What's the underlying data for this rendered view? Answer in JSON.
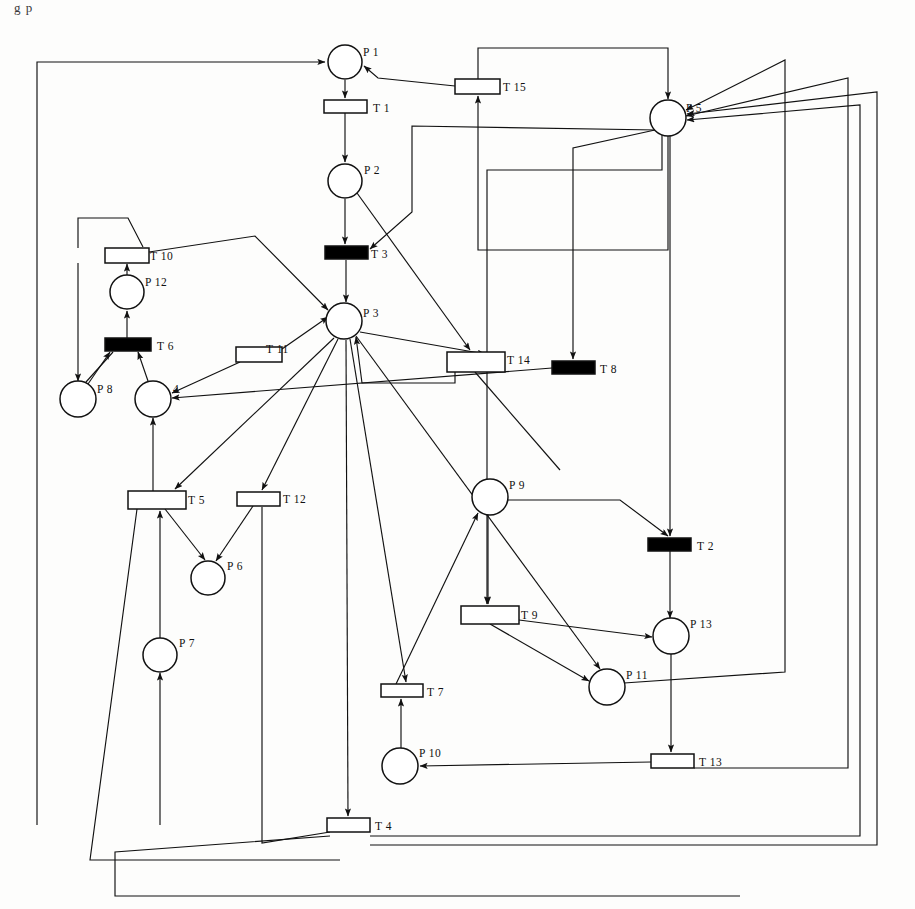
{
  "figure": {
    "title_fragment": "g   p",
    "type": "petri-net",
    "background": "#fdfdfc",
    "stroke": "#111111",
    "fill_place": "#ffffff",
    "fill_transition_immediate": "#ffffff",
    "fill_transition_timed": "#000000"
  },
  "places": [
    {
      "id": "P1",
      "label": "P 1",
      "cx": 345,
      "cy": 62,
      "r": 17,
      "label_dx": 18,
      "label_dy": -6
    },
    {
      "id": "P2",
      "label": "P 2",
      "cx": 345,
      "cy": 181,
      "r": 17,
      "label_dx": 19,
      "label_dy": -7
    },
    {
      "id": "P3",
      "label": "P 3",
      "cx": 344,
      "cy": 321,
      "r": 18,
      "label_dx": 19,
      "label_dy": -4
    },
    {
      "id": "P4",
      "label": "4",
      "cx": 153,
      "cy": 399,
      "r": 18,
      "label_dx": 20,
      "label_dy": -6
    },
    {
      "id": "P5",
      "label": "P 5",
      "cx": 668,
      "cy": 118,
      "r": 18,
      "label_dx": 18,
      "label_dy": -6
    },
    {
      "id": "P6",
      "label": "P 6",
      "cx": 208,
      "cy": 578,
      "r": 17,
      "label_dx": 19,
      "label_dy": -8
    },
    {
      "id": "P7",
      "label": "P 7",
      "cx": 160,
      "cy": 655,
      "r": 17,
      "label_dx": 19,
      "label_dy": -8
    },
    {
      "id": "P8",
      "label": "P 8",
      "cx": 78,
      "cy": 399,
      "r": 18,
      "label_dx": 19,
      "label_dy": -6
    },
    {
      "id": "P9",
      "label": "P 9",
      "cx": 490,
      "cy": 497,
      "r": 18,
      "label_dx": 19,
      "label_dy": -8
    },
    {
      "id": "P10",
      "label": "P 10",
      "cx": 400,
      "cy": 766,
      "r": 18,
      "label_dx": 19,
      "label_dy": -9
    },
    {
      "id": "P11",
      "label": "P 11",
      "cx": 607,
      "cy": 687,
      "r": 18,
      "label_dx": 19,
      "label_dy": -8
    },
    {
      "id": "P12",
      "label": "P 12",
      "cx": 127,
      "cy": 292,
      "r": 17,
      "label_dx": 18,
      "label_dy": -6
    },
    {
      "id": "P13",
      "label": "P 13",
      "cx": 671,
      "cy": 636,
      "r": 18,
      "label_dx": 19,
      "label_dy": -8
    }
  ],
  "transitions": [
    {
      "id": "T1",
      "label": "T 1",
      "x": 324,
      "y": 100,
      "w": 43,
      "h": 13,
      "timed": false,
      "label_dx": 49,
      "label_dy": 1
    },
    {
      "id": "T2",
      "label": "T 2",
      "x": 648,
      "y": 538,
      "w": 43,
      "h": 13,
      "timed": true,
      "label_dx": 49,
      "label_dy": 1
    },
    {
      "id": "T3",
      "label": "T 3",
      "x": 325,
      "y": 246,
      "w": 43,
      "h": 13,
      "timed": true,
      "label_dx": 46,
      "label_dy": 1
    },
    {
      "id": "T4",
      "label": "T 4",
      "x": 327,
      "y": 818,
      "w": 43,
      "h": 14,
      "timed": false,
      "label_dx": 48,
      "label_dy": 1
    },
    {
      "id": "T5",
      "label": "T 5",
      "x": 128,
      "y": 491,
      "w": 58,
      "h": 18,
      "timed": false,
      "label_dx": 60,
      "label_dy": 0
    },
    {
      "id": "T6",
      "label": "T 6",
      "x": 105,
      "y": 338,
      "w": 46,
      "h": 13,
      "timed": true,
      "label_dx": 52,
      "label_dy": 1
    },
    {
      "id": "T7",
      "label": "T 7",
      "x": 381,
      "y": 684,
      "w": 42,
      "h": 13,
      "timed": false,
      "label_dx": 46,
      "label_dy": 1
    },
    {
      "id": "T8",
      "label": "T 8",
      "x": 552,
      "y": 361,
      "w": 43,
      "h": 13,
      "timed": true,
      "label_dx": 48,
      "label_dy": 1
    },
    {
      "id": "T9",
      "label": "T 9",
      "x": 461,
      "y": 606,
      "w": 58,
      "h": 18,
      "timed": false,
      "label_dx": 60,
      "label_dy": 0
    },
    {
      "id": "T10",
      "label": "T 10",
      "x": 105,
      "y": 248,
      "w": 44,
      "h": 15,
      "timed": false,
      "label_dx": 45,
      "label_dy": 0
    },
    {
      "id": "T11",
      "label": "T 11",
      "x": 236,
      "y": 347,
      "w": 46,
      "h": 15,
      "timed": false,
      "label_dx": 30,
      "label_dy": -6
    },
    {
      "id": "T12",
      "label": "T 12",
      "x": 237,
      "y": 492,
      "w": 43,
      "h": 14,
      "timed": false,
      "label_dx": 46,
      "label_dy": 0
    },
    {
      "id": "T13",
      "label": "T 13",
      "x": 651,
      "y": 754,
      "w": 43,
      "h": 14,
      "timed": false,
      "label_dx": 48,
      "label_dy": 1
    },
    {
      "id": "T14",
      "label": "T 14",
      "x": 447,
      "y": 352,
      "w": 58,
      "h": 20,
      "timed": false,
      "label_dx": 60,
      "label_dy": -2
    },
    {
      "id": "T15",
      "label": "T 15",
      "x": 455,
      "y": 79,
      "w": 45,
      "h": 15,
      "timed": false,
      "label_dx": 48,
      "label_dy": 0
    }
  ],
  "arcs": [
    {
      "from": "T15",
      "to": "P1",
      "path": "M455,86 L378,78 L364,66",
      "arrow": true
    },
    {
      "from": "T4",
      "to": "P1",
      "path": "M37,825 L37,62 L325,62",
      "arrow": true
    },
    {
      "from": "P1",
      "to": "T1",
      "path": "M345,80 L345,98",
      "arrow": true
    },
    {
      "from": "T1",
      "to": "P2",
      "path": "M345,113 L345,162",
      "arrow": true
    },
    {
      "from": "P2",
      "to": "T3",
      "path": "M345,199 L345,244",
      "arrow": true
    },
    {
      "from": "P2",
      "to": "T14",
      "path": "M357,193 L470,350",
      "arrow": true
    },
    {
      "from": "T3",
      "to": "P3",
      "path": "M346,260 L346,302",
      "arrow": true
    },
    {
      "from": "P5",
      "to": "T3",
      "path": "M657,130 L412,126 L412,212 L370,249",
      "arrow": true
    },
    {
      "from": "T15",
      "to": "P5",
      "path": "M478,79 L478,48 L668,48 L668,99",
      "arrow": true
    },
    {
      "from": "P5",
      "to": "T15",
      "path": "M668,136 L668,250 L478,250 L478,96",
      "arrow": true
    },
    {
      "from": "T10",
      "to": "P3",
      "path": "M149,252 L255,236 L328,310",
      "arrow": true
    },
    {
      "from": "T6",
      "to": "P12",
      "path": "M127,338 L127,311",
      "arrow": true
    },
    {
      "from": "P12",
      "to": "T10",
      "path": "M127,275 L127,264",
      "arrow": true
    },
    {
      "from": "T10b",
      "to": "P12",
      "path": "M78,248 L78,218 L128,218 L143,247",
      "arrow": false
    },
    {
      "from": "T6",
      "to": "P8",
      "path": "M113,352 L86,382",
      "arrow": false
    },
    {
      "from": "T10",
      "to": "P8",
      "path": "M78,263 L78,381",
      "arrow": true
    },
    {
      "from": "P4",
      "to": "T6",
      "path": "M148,381 L138,352",
      "arrow": true
    },
    {
      "from": "P8",
      "to": "T6",
      "path": "M88,384 L110,352",
      "arrow": true
    },
    {
      "from": "T11",
      "to": "P3",
      "path": "M282,349 L328,317",
      "arrow": true
    },
    {
      "from": "T11",
      "to": "P4",
      "path": "M240,362 L172,393",
      "arrow": true
    },
    {
      "from": "P3",
      "to": "T14",
      "path": "M360,332 L485,354",
      "arrow": true
    },
    {
      "from": "T14",
      "to": "P3",
      "path": "M455,372 L455,383 L362,383 L356,337",
      "arrow": true
    },
    {
      "from": "T8",
      "to": "P4",
      "path": "M552,368 L172,398",
      "arrow": true
    },
    {
      "from": "P5",
      "to": "T8",
      "path": "M655,130 L573,148 L573,359",
      "arrow": true
    },
    {
      "from": "T14",
      "to": "T8",
      "path": "M475,372 L560,470",
      "arrow": false
    },
    {
      "from": "P3",
      "to": "T5",
      "path": "M334,338 L175,489",
      "arrow": true
    },
    {
      "from": "P3",
      "to": "T12",
      "path": "M338,339 L262,490",
      "arrow": true
    },
    {
      "from": "T5",
      "to": "P4",
      "path": "M153,491 L153,418",
      "arrow": true
    },
    {
      "from": "T5",
      "to": "P6",
      "path": "M165,509 L205,560",
      "arrow": true
    },
    {
      "from": "T12",
      "to": "P6",
      "path": "M253,506 L216,561",
      "arrow": true
    },
    {
      "from": "P7",
      "to": "T5",
      "path": "M160,638 L160,511",
      "arrow": true
    },
    {
      "from": "T4",
      "to": "P7",
      "path": "M160,825 L160,673",
      "arrow": true
    },
    {
      "from": "T12",
      "to": "T4",
      "path": "M262,507 L262,843 L330,832",
      "arrow": false
    },
    {
      "from": "P3",
      "to": "T4",
      "path": "M346,340 L348,816",
      "arrow": true
    },
    {
      "from": "P9",
      "to": "T9",
      "path": "M488,515 L488,604",
      "arrow": true
    },
    {
      "from": "P3",
      "to": "T7",
      "path": "M350,339 L406,682",
      "arrow": true
    },
    {
      "from": "T7",
      "to": "P9",
      "path": "M396,684 L478,513",
      "arrow": true
    },
    {
      "from": "P10",
      "to": "T7",
      "path": "M401,748 L401,699",
      "arrow": true
    },
    {
      "from": "T9",
      "to": "P13",
      "path": "M519,620 L652,637",
      "arrow": true
    },
    {
      "from": "T9",
      "to": "P11",
      "path": "M490,624 L589,681",
      "arrow": true
    },
    {
      "from": "P5",
      "to": "T9",
      "path": "M662,135 L662,170 L487,170 L487,604",
      "arrow": true
    },
    {
      "from": "P3",
      "to": "P11",
      "path": "M356,336 L600,669",
      "arrow": true
    },
    {
      "from": "P9",
      "to": "T2",
      "path": "M508,500 L620,500 L668,536",
      "arrow": true
    },
    {
      "from": "P5",
      "to": "T2",
      "path": "M670,136 L670,536",
      "arrow": true
    },
    {
      "from": "T2",
      "to": "P13",
      "path": "M670,551 L670,618",
      "arrow": true
    },
    {
      "from": "P13",
      "to": "T13",
      "path": "M671,654 L671,752",
      "arrow": true
    },
    {
      "from": "T13",
      "to": "P10",
      "path": "M651,762 L420,766",
      "arrow": true
    },
    {
      "from": "P11",
      "to": "P5",
      "path": "M624,683 L785,672 L785,60 L686,110",
      "arrow": true
    },
    {
      "from": "T13",
      "to": "P5",
      "path": "M694,768 L848,768 L848,78 L686,116",
      "arrow": true
    },
    {
      "from": "T4",
      "to": "P5",
      "path": "M370,836 L860,836 L860,105 L687,120",
      "arrow": true
    },
    {
      "from": "T4",
      "to": "P5b",
      "path": "M370,845 L877,845 L877,92 L687,114",
      "arrow": true
    },
    {
      "from": "T4",
      "to": "P3",
      "path": "M330,836 L115,852 L115,896 L740,896",
      "arrow": false
    },
    {
      "from": "T5",
      "to": "T4",
      "path": "M137,509 L90,860 L340,860",
      "arrow": false
    }
  ],
  "arc_count": 52
}
